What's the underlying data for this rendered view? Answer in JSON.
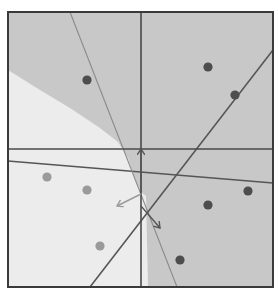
{
  "diagram": {
    "type": "classification-regions",
    "frame": {
      "x": 8,
      "y": 12,
      "width": 265,
      "height": 275
    },
    "colors": {
      "background": "#ffffff",
      "region_dark": "#c8c8c8",
      "region_light": "#ececec",
      "frame": "#3a3a3a",
      "axis_line": "#4a4a4a",
      "dark_line": "#555555",
      "thin_line": "#8a8a8a",
      "dot_dark": "#4d4d4d",
      "dot_light": "#9a9a9a",
      "arrow_dark": "#555555",
      "arrow_light": "#9a9a9a"
    },
    "axes": {
      "vertical": {
        "x": 141
      },
      "horizontal": {
        "y": 149
      }
    },
    "lines": [
      {
        "name": "shallow-boundary",
        "x1": 8,
        "y1": 161,
        "x2": 273,
        "y2": 183
      },
      {
        "name": "steep-thin-boundary",
        "x1": 70,
        "y1": 12,
        "x2": 177,
        "y2": 287
      },
      {
        "name": "diagonal-boundary",
        "x1": 273,
        "y1": 50,
        "x2": 90,
        "y2": 287
      }
    ],
    "points": {
      "class_dark": [
        {
          "x": 87,
          "y": 80
        },
        {
          "x": 208,
          "y": 67
        },
        {
          "x": 235,
          "y": 95
        },
        {
          "x": 248,
          "y": 191
        },
        {
          "x": 208,
          "y": 205
        },
        {
          "x": 180,
          "y": 260
        }
      ],
      "class_light": [
        {
          "x": 47,
          "y": 177
        },
        {
          "x": 87,
          "y": 190
        },
        {
          "x": 100,
          "y": 246
        }
      ]
    },
    "arrows": [
      {
        "name": "arrow-up",
        "x1": 141,
        "y1": 192,
        "x2": 141,
        "y2": 149
      },
      {
        "name": "arrow-lower-left",
        "x1": 141,
        "y1": 194,
        "x2": 117,
        "y2": 206
      },
      {
        "name": "arrow-lower-right",
        "x1": 141,
        "y1": 206,
        "x2": 160,
        "y2": 228
      }
    ]
  }
}
